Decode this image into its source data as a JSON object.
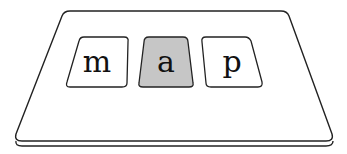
{
  "diagram": {
    "board": {
      "fill": "#ffffff",
      "stroke": "#222222"
    },
    "cards": [
      {
        "letter": "m",
        "highlighted": false,
        "fill": "#ffffff"
      },
      {
        "letter": "a",
        "highlighted": true,
        "fill": "#c6c6c6"
      },
      {
        "letter": "p",
        "highlighted": false,
        "fill": "#ffffff"
      }
    ]
  }
}
